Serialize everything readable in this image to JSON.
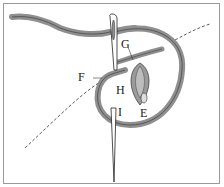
{
  "diagram": {
    "labels": {
      "G": "G",
      "F": "F",
      "H": "H",
      "I": "I",
      "E": "E"
    },
    "colors": {
      "thread": "#8f8f8f",
      "thread_dark": "#5a5a5a",
      "needle": "#ffffff",
      "outline": "#222222",
      "border": "#9a9a9a"
    }
  }
}
